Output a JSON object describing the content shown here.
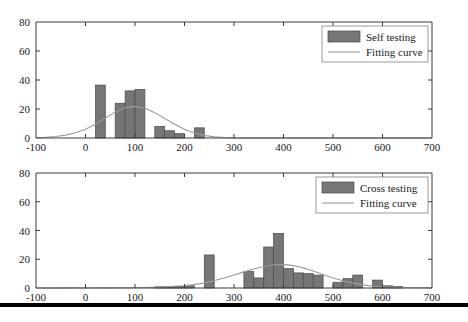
{
  "figure": {
    "background_color": "#ffffff",
    "bar_color": "#767676",
    "bar_edge_color": "#4a4a4a",
    "curve_color": "#9a9a9a",
    "axis_color": "#3a3a3a",
    "rule_color": "#000000"
  },
  "chart_data": [
    {
      "type": "bar",
      "id": "self-testing-histogram",
      "title": "",
      "xlabel": "",
      "ylabel": "",
      "xlim": [
        -100,
        700
      ],
      "ylim": [
        0,
        80
      ],
      "xticks": [
        -100,
        0,
        100,
        200,
        300,
        400,
        500,
        600,
        700
      ],
      "xtick_labels": [
        "-100",
        "0",
        "100",
        "200",
        "300",
        "400",
        "500",
        "600",
        "700"
      ],
      "yticks": [
        0,
        20,
        40,
        60,
        80
      ],
      "ytick_labels": [
        "0",
        "20",
        "40",
        "60",
        "80"
      ],
      "grid": false,
      "bin_width": 20,
      "bins": [
        {
          "x0": 20,
          "x1": 40,
          "value": 36.5
        },
        {
          "x0": 60,
          "x1": 80,
          "value": 24.0
        },
        {
          "x0": 80,
          "x1": 100,
          "value": 32.5
        },
        {
          "x0": 100,
          "x1": 120,
          "value": 33.5
        },
        {
          "x0": 140,
          "x1": 160,
          "value": 8.0
        },
        {
          "x0": 160,
          "x1": 180,
          "value": 5.0
        },
        {
          "x0": 180,
          "x1": 200,
          "value": 3.0
        },
        {
          "x0": 220,
          "x1": 240,
          "value": 7.0
        }
      ],
      "fit_curve": {
        "name": "Fitting curve",
        "x": [
          -100,
          -80,
          -60,
          -40,
          -20,
          0,
          20,
          40,
          60,
          80,
          100,
          120,
          140,
          160,
          180,
          200,
          220,
          240,
          260,
          280,
          300,
          700
        ],
        "y": [
          0.2,
          0.5,
          1.0,
          2.0,
          3.6,
          6.0,
          9.5,
          13.8,
          18.0,
          21.0,
          21.8,
          20.5,
          17.5,
          13.5,
          9.5,
          6.0,
          3.5,
          1.8,
          0.8,
          0.3,
          0.1,
          0.0
        ]
      },
      "legend": {
        "position": "upper right",
        "entries": [
          {
            "marker": "bar",
            "label": "Self testing"
          },
          {
            "marker": "line",
            "label": "Fitting curve"
          }
        ]
      }
    },
    {
      "type": "bar",
      "id": "cross-testing-histogram",
      "title": "",
      "xlabel": "",
      "ylabel": "",
      "xlim": [
        -100,
        700
      ],
      "ylim": [
        0,
        80
      ],
      "xticks": [
        -100,
        0,
        100,
        200,
        300,
        400,
        500,
        600,
        700
      ],
      "xtick_labels": [
        "-100",
        "0",
        "100",
        "200",
        "300",
        "400",
        "500",
        "600",
        "700"
      ],
      "yticks": [
        0,
        20,
        40,
        60,
        80
      ],
      "ytick_labels": [
        "0",
        "20",
        "40",
        "60",
        "80"
      ],
      "grid": false,
      "bin_width": 20,
      "bins": [
        {
          "x0": 140,
          "x1": 160,
          "value": 0.8
        },
        {
          "x0": 160,
          "x1": 180,
          "value": 1.0
        },
        {
          "x0": 180,
          "x1": 200,
          "value": 1.2
        },
        {
          "x0": 200,
          "x1": 220,
          "value": 1.5
        },
        {
          "x0": 240,
          "x1": 260,
          "value": 23.0
        },
        {
          "x0": 320,
          "x1": 340,
          "value": 11.5
        },
        {
          "x0": 340,
          "x1": 360,
          "value": 7.0
        },
        {
          "x0": 360,
          "x1": 380,
          "value": 28.5
        },
        {
          "x0": 380,
          "x1": 400,
          "value": 38.0
        },
        {
          "x0": 400,
          "x1": 420,
          "value": 13.5
        },
        {
          "x0": 420,
          "x1": 440,
          "value": 10.5
        },
        {
          "x0": 440,
          "x1": 460,
          "value": 10.0
        },
        {
          "x0": 460,
          "x1": 480,
          "value": 9.0
        },
        {
          "x0": 500,
          "x1": 520,
          "value": 4.0
        },
        {
          "x0": 520,
          "x1": 540,
          "value": 6.5
        },
        {
          "x0": 540,
          "x1": 560,
          "value": 9.0
        },
        {
          "x0": 580,
          "x1": 600,
          "value": 5.5
        },
        {
          "x0": 600,
          "x1": 620,
          "value": 1.5
        },
        {
          "x0": 620,
          "x1": 640,
          "value": 1.0
        }
      ],
      "fit_curve": {
        "name": "Fitting curve",
        "x": [
          -100,
          100,
          150,
          200,
          240,
          280,
          300,
          320,
          340,
          360,
          380,
          400,
          420,
          440,
          460,
          480,
          500,
          520,
          540,
          560,
          580,
          600,
          640,
          700
        ],
        "y": [
          0.0,
          0.2,
          0.6,
          1.6,
          3.4,
          7.0,
          9.0,
          11.2,
          13.2,
          15.0,
          16.2,
          16.4,
          15.6,
          14.0,
          11.8,
          9.4,
          7.0,
          5.0,
          3.4,
          2.2,
          1.4,
          0.9,
          0.3,
          0.1
        ]
      },
      "legend": {
        "position": "upper right",
        "entries": [
          {
            "marker": "bar",
            "label": "Cross testing"
          },
          {
            "marker": "line",
            "label": "Fitting curve"
          }
        ]
      }
    }
  ]
}
